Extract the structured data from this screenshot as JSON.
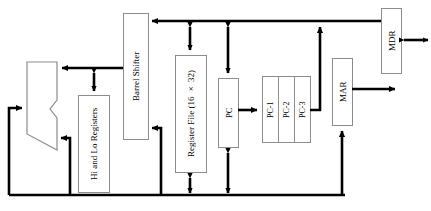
{
  "diagram": {
    "orientation": "vertical-text-blocks",
    "stroke_color": "#000000",
    "box_border_color": "#8c8c8c",
    "background_color": "#ffffff",
    "blocks": [
      {
        "id": "alu",
        "label": "",
        "shape": "alu-trapezoid"
      },
      {
        "id": "hi-lo",
        "label": "Hi and Lo Registers",
        "shape": "rect"
      },
      {
        "id": "barrel-shifter",
        "label": "Barrel Shifter",
        "shape": "rect"
      },
      {
        "id": "register-file",
        "label": "Register File (16 × 32)",
        "shape": "rect"
      },
      {
        "id": "pc",
        "label": "PC",
        "shape": "rect"
      },
      {
        "id": "pc-1",
        "label": "PC-1",
        "shape": "rect"
      },
      {
        "id": "pc-2",
        "label": "PC-2",
        "shape": "rect"
      },
      {
        "id": "pc-3",
        "label": "PC-3",
        "shape": "rect"
      },
      {
        "id": "mar",
        "label": "MAR",
        "shape": "rect"
      },
      {
        "id": "mdr",
        "label": "MDR",
        "shape": "rect"
      }
    ],
    "labels": {
      "hi_lo": "Hi and Lo Registers",
      "barrel_shifter": "Barrel Shifter",
      "register_file": "Register File (16 × 32)",
      "pc": "PC",
      "pc_1": "PC-1",
      "pc_2": "PC-2",
      "pc_3": "PC-3",
      "mar": "MAR",
      "mdr": "MDR"
    },
    "buses": [
      {
        "id": "top-bus",
        "direction": "left",
        "note": "top horizontal bus into Barrel Shifter"
      },
      {
        "id": "bottom-bus",
        "direction": "horizontal",
        "note": "bottom horizontal result bus"
      },
      {
        "id": "left-bus",
        "direction": "up-then-right",
        "note": "feeds ALU left input"
      },
      {
        "id": "mdr-external",
        "direction": "bidirectional",
        "note": "MDR to memory"
      },
      {
        "id": "mar-external",
        "direction": "right",
        "note": "MAR address out"
      }
    ]
  }
}
